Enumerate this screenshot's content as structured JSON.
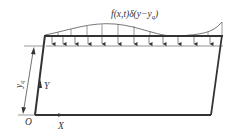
{
  "diagram": {
    "load_label": "f(x,t)δ(y−y",
    "load_label_sub": "q",
    "load_label_close": ")",
    "dimension_label": "y",
    "dimension_label_sub": "q",
    "axis_y_label": "Y",
    "axis_x_label": "X",
    "origin_label": "O",
    "colors": {
      "frame": "#333333",
      "thin_line": "#555555",
      "text": "#333333"
    },
    "load_arrow_count": 12
  }
}
